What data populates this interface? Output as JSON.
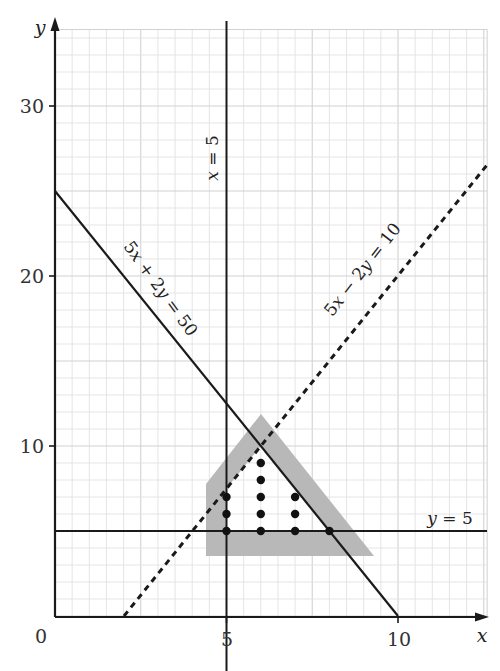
{
  "chart_data": {
    "type": "line",
    "title": "",
    "xlabel": "x",
    "ylabel": "y",
    "xlim": [
      0,
      12.6
    ],
    "ylim": [
      0,
      34.5
    ],
    "grid": true,
    "grid_spacing": {
      "x": 0.5,
      "y": 1
    },
    "x_ticks": [
      {
        "value": 0,
        "label": "0"
      },
      {
        "value": 5,
        "label": "5"
      },
      {
        "value": 10,
        "label": "10"
      }
    ],
    "y_ticks": [
      {
        "value": 10,
        "label": "10"
      },
      {
        "value": 20,
        "label": "20"
      },
      {
        "value": 30,
        "label": "30"
      }
    ],
    "origin_label": "0",
    "series": [
      {
        "name": "x = 5",
        "style": "solid",
        "points": [
          [
            5,
            0
          ],
          [
            5,
            34.5
          ]
        ]
      },
      {
        "name": "y = 5",
        "style": "solid",
        "points": [
          [
            0,
            5
          ],
          [
            12.6,
            5
          ]
        ]
      },
      {
        "name": "5x + 2y = 50",
        "style": "solid",
        "points": [
          [
            0,
            25
          ],
          [
            10,
            0
          ]
        ]
      },
      {
        "name": "5x − 2y = 10",
        "style": "dashed",
        "points": [
          [
            2,
            0
          ],
          [
            12.6,
            26.5
          ]
        ]
      }
    ],
    "feasible_region": {
      "vertices": [
        [
          5,
          5
        ],
        [
          5,
          7.5
        ],
        [
          6,
          10
        ],
        [
          8,
          5
        ]
      ],
      "shading": "gray band outside boundary",
      "shade_outline": [
        [
          4.4,
          7.8
        ],
        [
          6,
          11.9
        ],
        [
          9.3,
          3.55
        ],
        [
          4.4,
          3.55
        ]
      ]
    },
    "integer_points": [
      [
        5,
        5
      ],
      [
        5,
        6
      ],
      [
        5,
        7
      ],
      [
        6,
        5
      ],
      [
        6,
        6
      ],
      [
        6,
        7
      ],
      [
        6,
        8
      ],
      [
        6,
        9
      ],
      [
        7,
        5
      ],
      [
        7,
        6
      ],
      [
        7,
        7
      ],
      [
        8,
        5
      ]
    ],
    "annotations": [
      {
        "text": "x = 5",
        "rotation": -90
      },
      {
        "text": "y = 5",
        "rotation": 0
      },
      {
        "text": "5x + 2y = 50",
        "rotation": 54
      },
      {
        "text": "5x − 2y = 10",
        "rotation": -52
      }
    ]
  },
  "labels": {
    "x_axis": "x",
    "y_axis": "y",
    "origin": "0",
    "x5": "5",
    "x10": "10",
    "y10": "10",
    "y20": "20",
    "y30": "30",
    "eq_x5": "x = 5",
    "eq_y5": "y = 5",
    "eq_line1_a": "5",
    "eq_line1_b": "x",
    "eq_line1_c": " + 2",
    "eq_line1_d": "y",
    "eq_line1_e": " = 50",
    "eq_line2_a": "5",
    "eq_line2_b": "x",
    "eq_line2_c": " − 2",
    "eq_line2_d": "y",
    "eq_line2_e": " = 10"
  },
  "colors": {
    "axis": "#1a1a1a",
    "grid_minor": "#e2e2e2",
    "grid_major": "#d2d2d2",
    "shade": "#b8b8b8",
    "line": "#1a1a1a"
  }
}
